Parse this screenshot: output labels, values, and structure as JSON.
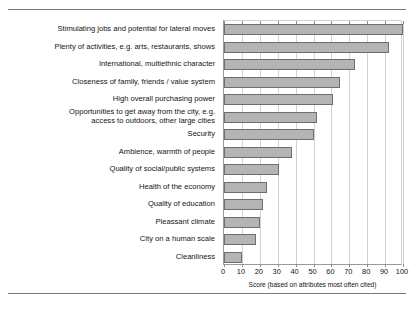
{
  "chart_data": {
    "type": "bar",
    "orientation": "horizontal",
    "title": "",
    "xlabel": "Score (based on attributes most often cited)",
    "ylabel": "",
    "xlim": [
      0,
      100
    ],
    "xticks": [
      0,
      10,
      20,
      30,
      40,
      50,
      60,
      70,
      80,
      90,
      100
    ],
    "grid": true,
    "legend": null,
    "bar_color": "#b4b4b4",
    "bar_edge_color": "#6e6e6e",
    "categories": [
      "Stimulating jobs and potential for lateral moves",
      "Plenty of activities, e.g. arts, restaurants, shows",
      "International, multiethnic character",
      "Closeness of family, friends / value system",
      "High overall purchasing power",
      "Opportunities to get away from the city, e.g.\naccess to outdoors, other large cities",
      "Security",
      "Ambience, warmth of people",
      "Quality of social/public systems",
      "Health of the economy",
      "Quality of education",
      "Pleassant climate",
      "City on a human scale",
      "Cleanliness"
    ],
    "values": [
      100,
      92,
      73,
      65,
      61,
      52,
      50,
      38,
      31,
      24,
      22,
      20,
      18,
      10
    ]
  }
}
